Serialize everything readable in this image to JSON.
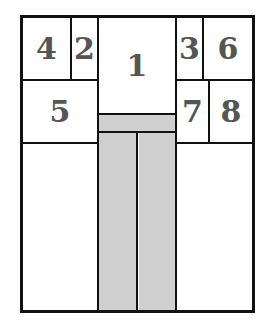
{
  "diagram": {
    "type": "floor-plan",
    "colors": {
      "line": "#111111",
      "fill_gray": "#cfcfcf",
      "label": "#555555",
      "background": "#ffffff"
    },
    "cells": [
      {
        "id": "cell-1",
        "label": "1"
      },
      {
        "id": "cell-2",
        "label": "2"
      },
      {
        "id": "cell-3",
        "label": "3"
      },
      {
        "id": "cell-4",
        "label": "4"
      },
      {
        "id": "cell-5",
        "label": "5"
      },
      {
        "id": "cell-6",
        "label": "6"
      },
      {
        "id": "cell-7",
        "label": "7"
      },
      {
        "id": "cell-8",
        "label": "8"
      }
    ]
  }
}
